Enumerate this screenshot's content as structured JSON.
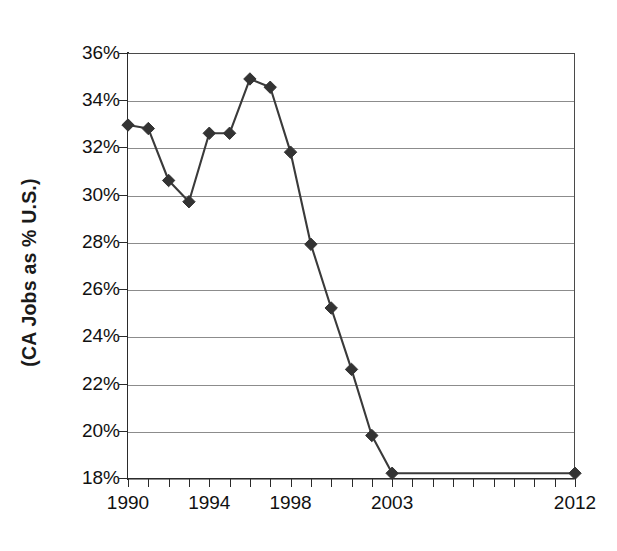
{
  "chart_data": {
    "type": "line",
    "title": "",
    "xlabel": "",
    "ylabel": "(CA Jobs as % U.S.)",
    "x": [
      1990,
      1991,
      1992,
      1993,
      1994,
      1995,
      1996,
      1997,
      1998,
      1999,
      2000,
      2001,
      2002,
      2003,
      2012
    ],
    "values": [
      32.95,
      32.8,
      30.6,
      29.7,
      32.6,
      32.6,
      34.9,
      34.55,
      31.8,
      27.9,
      25.2,
      22.6,
      19.8,
      18.2,
      18.2
    ],
    "series": [
      {
        "name": "CA Jobs as % U.S.",
        "values": [
          32.95,
          32.8,
          30.6,
          29.7,
          32.6,
          32.6,
          34.9,
          34.55,
          31.8,
          27.9,
          25.2,
          22.6,
          19.8,
          18.2,
          18.2
        ]
      }
    ],
    "xlim": [
      1990,
      2012
    ],
    "ylim": [
      18,
      36
    ],
    "y_ticks": [
      18,
      20,
      22,
      24,
      26,
      28,
      30,
      32,
      34,
      36
    ],
    "y_tick_labels": [
      "18%",
      "20%",
      "22%",
      "24%",
      "26%",
      "28%",
      "30%",
      "32%",
      "34%",
      "36%"
    ],
    "x_tick_labels": [
      {
        "value": 1990,
        "label": "1990"
      },
      {
        "value": 1994,
        "label": "1994"
      },
      {
        "value": 1998,
        "label": "1998"
      },
      {
        "value": 2003,
        "label": "2003"
      },
      {
        "value": 2012,
        "label": "2012"
      }
    ],
    "x_tick_values": [
      1990,
      1991,
      1992,
      1993,
      1994,
      1995,
      1996,
      1997,
      1998,
      1999,
      2000,
      2001,
      2002,
      2003,
      2004,
      2005,
      2006,
      2007,
      2008,
      2009,
      2010,
      2011,
      2012
    ],
    "grid": "horizontal",
    "legend": "none",
    "marker": "diamond",
    "colors": {
      "line": "#3a3a3a",
      "marker": "#333333",
      "gridline": "#8c8c8c",
      "axis": "#2b2b2b",
      "text": "#111111",
      "background": "#ffffff"
    }
  }
}
